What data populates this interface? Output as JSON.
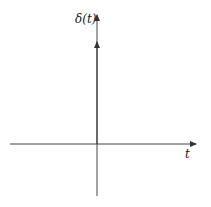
{
  "diagram": {
    "y_axis_label": "δ(t)",
    "x_axis_label": "t",
    "impulse": {
      "position": 0,
      "height_label": ""
    },
    "colors": {
      "axis": "#333333",
      "background": "#ffffff"
    }
  }
}
